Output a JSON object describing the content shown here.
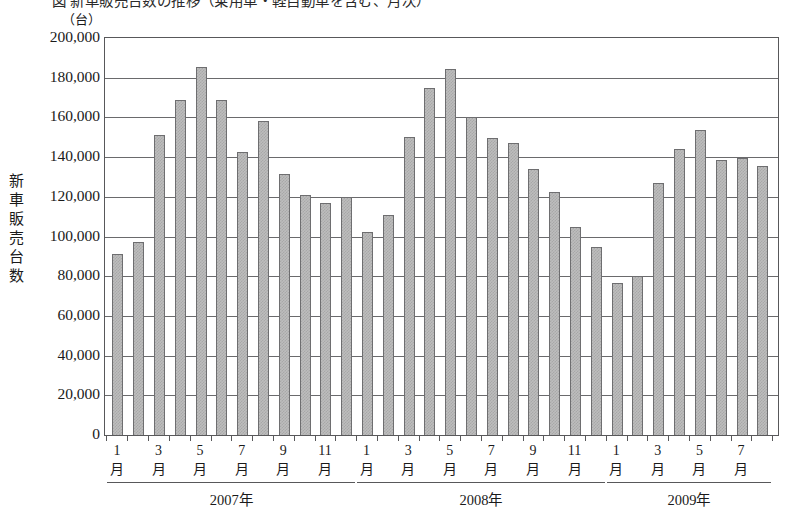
{
  "title": "図  新車販売台数の推移（乗用車・軽自動車を含む、月次）",
  "unit_label": "（台）",
  "y_axis_title": [
    "新",
    "車",
    "販",
    "売",
    "台",
    "数"
  ],
  "chart_data": {
    "type": "bar",
    "title": "図  新車販売台数の推移（乗用車・軽自動車を含む、月次）",
    "xlabel": "",
    "ylabel": "新車販売台数",
    "unit": "台",
    "ylim": [
      0,
      200000
    ],
    "ytick_step": 20000,
    "ytick_labels": [
      "200,000",
      "180,000",
      "160,000",
      "140,000",
      "120,000",
      "100,000",
      "80,000",
      "60,000",
      "40,000",
      "20,000",
      "0"
    ],
    "ytick_values": [
      200000,
      180000,
      160000,
      140000,
      120000,
      100000,
      80000,
      60000,
      40000,
      20000,
      0
    ],
    "grid": true,
    "legend": "none",
    "categories": [
      "2007-1",
      "2007-2",
      "2007-3",
      "2007-4",
      "2007-5",
      "2007-6",
      "2007-7",
      "2007-8",
      "2007-9",
      "2007-10",
      "2007-11",
      "2007-12",
      "2008-1",
      "2008-2",
      "2008-3",
      "2008-4",
      "2008-5",
      "2008-6",
      "2008-7",
      "2008-8",
      "2008-9",
      "2008-10",
      "2008-11",
      "2008-12",
      "2009-1",
      "2009-2",
      "2009-3",
      "2009-4",
      "2009-5",
      "2009-6",
      "2009-7",
      "2009-8"
    ],
    "values": [
      91000,
      97000,
      151000,
      169000,
      185500,
      169000,
      142500,
      158000,
      131500,
      121000,
      117000,
      120000,
      102500,
      111000,
      150000,
      175000,
      184500,
      160000,
      149500,
      147000,
      134000,
      122500,
      105000,
      94500,
      76500,
      80000,
      127000,
      144000,
      153500,
      138500,
      139500,
      135500
    ],
    "x_tick_labels": [
      {
        "index": 0,
        "line1": "1",
        "line2": "月"
      },
      {
        "index": 2,
        "line1": "3",
        "line2": "月"
      },
      {
        "index": 4,
        "line1": "5",
        "line2": "月"
      },
      {
        "index": 6,
        "line1": "7",
        "line2": "月"
      },
      {
        "index": 8,
        "line1": "9",
        "line2": "月"
      },
      {
        "index": 10,
        "line1": "11",
        "line2": "月"
      },
      {
        "index": 12,
        "line1": "1",
        "line2": "月"
      },
      {
        "index": 14,
        "line1": "3",
        "line2": "月"
      },
      {
        "index": 16,
        "line1": "5",
        "line2": "月"
      },
      {
        "index": 18,
        "line1": "7",
        "line2": "月"
      },
      {
        "index": 20,
        "line1": "9",
        "line2": "月"
      },
      {
        "index": 22,
        "line1": "11",
        "line2": "月"
      },
      {
        "index": 24,
        "line1": "1",
        "line2": "月"
      },
      {
        "index": 26,
        "line1": "3",
        "line2": "月"
      },
      {
        "index": 28,
        "line1": "5",
        "line2": "月"
      },
      {
        "index": 30,
        "line1": "7",
        "line2": "月"
      }
    ],
    "year_groups": [
      {
        "label": "2007年",
        "start_index": 0,
        "end_index": 11
      },
      {
        "label": "2008年",
        "start_index": 12,
        "end_index": 23
      },
      {
        "label": "2009年",
        "start_index": 24,
        "end_index": 31
      }
    ],
    "colors": {
      "bar_fill": "#bdbdbd",
      "bar_pattern": "#a8a8a8",
      "bar_border": "#6e6e70",
      "gridline": "#6a6a6c",
      "frame": "#58585a",
      "text": "#1a1a1a",
      "background": "#ffffff"
    }
  }
}
